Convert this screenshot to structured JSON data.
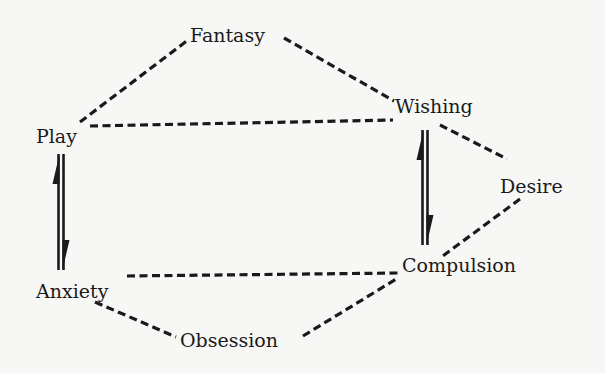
{
  "diagram": {
    "type": "concept-network",
    "nodes": [
      {
        "id": "fantasy",
        "label": "Fantasy"
      },
      {
        "id": "wishing",
        "label": "Wishing"
      },
      {
        "id": "play",
        "label": "Play"
      },
      {
        "id": "desire",
        "label": "Desire"
      },
      {
        "id": "anxiety",
        "label": "Anxiety"
      },
      {
        "id": "compulsion",
        "label": "Compulsion"
      },
      {
        "id": "obsession",
        "label": "Obsession"
      }
    ],
    "edges": [
      {
        "from": "play",
        "to": "fantasy",
        "style": "dashed"
      },
      {
        "from": "fantasy",
        "to": "wishing",
        "style": "dashed"
      },
      {
        "from": "play",
        "to": "wishing",
        "style": "dashed"
      },
      {
        "from": "wishing",
        "to": "desire",
        "style": "dashed"
      },
      {
        "from": "desire",
        "to": "compulsion",
        "style": "dashed"
      },
      {
        "from": "anxiety",
        "to": "compulsion",
        "style": "dashed"
      },
      {
        "from": "anxiety",
        "to": "obsession",
        "style": "dashed"
      },
      {
        "from": "obsession",
        "to": "compulsion",
        "style": "dashed"
      }
    ],
    "reversible_arrows": [
      {
        "between": [
          "play",
          "anxiety"
        ],
        "style": "equilibrium-half-arrows"
      },
      {
        "between": [
          "wishing",
          "compulsion"
        ],
        "style": "equilibrium-half-arrows"
      }
    ]
  }
}
